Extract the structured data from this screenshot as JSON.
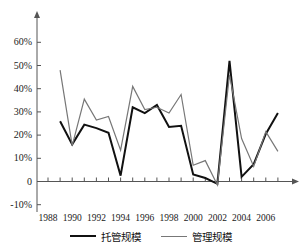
{
  "chart_data": {
    "type": "line",
    "title": "",
    "xlabel": "",
    "ylabel": "",
    "ylim": [
      -10,
      65
    ],
    "ytick_values": [
      60,
      50,
      40,
      30,
      20,
      10,
      0,
      -10
    ],
    "ytick_labels": [
      "60%",
      "50%",
      "40%",
      "30%",
      "20%",
      "10%",
      "0",
      "-10%"
    ],
    "xtick_labels": [
      "1988",
      "1990",
      "1992",
      "1994",
      "1996",
      "1998",
      "2000",
      "2002",
      "2004",
      "2006"
    ],
    "xtick_values": [
      1988,
      1990,
      1992,
      1994,
      1996,
      1998,
      2000,
      2002,
      2004,
      2006
    ],
    "x": [
      1989,
      1990,
      1991,
      1992,
      1993,
      1994,
      1995,
      1996,
      1997,
      1998,
      1999,
      2000,
      2001,
      2002,
      2003,
      2004,
      2005,
      2006,
      2007
    ],
    "grid": false,
    "legend_position": "bottom",
    "series": [
      {
        "name": "托管规模",
        "color": "#111111",
        "width": 2.0,
        "values": [
          26,
          16,
          24.5,
          23,
          21,
          2.5,
          32,
          29.5,
          33,
          23.5,
          24,
          3,
          1.5,
          -1,
          52,
          2,
          7.5,
          20.5,
          29.5
        ]
      },
      {
        "name": "管理规模",
        "color": "#777777",
        "width": 1.2,
        "values": [
          48,
          15.5,
          35.5,
          26.5,
          28,
          13.5,
          41,
          31,
          32,
          29.5,
          37.5,
          7,
          9,
          -1.5,
          46,
          18.5,
          6.5,
          21.5,
          13
        ]
      }
    ]
  },
  "legend": {
    "entries": [
      {
        "label": "托管规模"
      },
      {
        "label": "管理规模"
      }
    ]
  },
  "colors": {
    "series_1": "#111111",
    "series_2": "#777777",
    "axis": "#555555",
    "text": "#1a1a1a",
    "background": "#ffffff"
  }
}
